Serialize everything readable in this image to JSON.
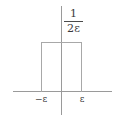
{
  "figure": {
    "kind": "boxcar-pulse-diagram",
    "background_color": "#ffffff",
    "line_color": "#9a9a9a",
    "text_color": "#3b3b3b"
  },
  "axes": {
    "x_axis_name": "horizontal-axis",
    "y_axis_name": "vertical-axis"
  },
  "labels": {
    "height_numerator": "1",
    "height_denominator": "2ε",
    "tick_negative": "−ε",
    "tick_positive": "ε"
  },
  "chart_data": {
    "type": "line",
    "title": "",
    "subtitle": "",
    "xlabel": "",
    "ylabel": "",
    "grid": false,
    "legend": null,
    "xlim": [
      -2.4,
      2.4
    ],
    "ylim": [
      0,
      1.25
    ],
    "xticks": [
      -1,
      1
    ],
    "xticklabels": [
      "−ε",
      "ε"
    ],
    "yticks": [
      1
    ],
    "yticklabels": [
      "1/2ε"
    ],
    "series": [
      {
        "name": "pulse",
        "x": [
          -2.4,
          -1,
          -1,
          1,
          1,
          2.4
        ],
        "values": [
          0,
          0,
          1,
          1,
          0,
          0
        ]
      }
    ],
    "annotations": [
      {
        "text": "1",
        "role": "fraction-numerator",
        "x": 0.35,
        "y": 1.2
      },
      {
        "text": "2ε",
        "role": "fraction-denominator",
        "x": 0.35,
        "y": 1.05
      },
      {
        "text": "−ε",
        "role": "x-tick",
        "x": -1,
        "y": -0.08
      },
      {
        "text": "ε",
        "role": "x-tick",
        "x": 1,
        "y": -0.08
      }
    ]
  }
}
